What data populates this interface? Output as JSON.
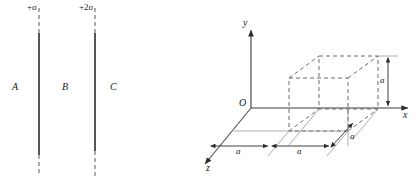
{
  "figure_left": {
    "name": "two-parallel-charged-sheets",
    "sheet_labels": [
      {
        "id": "sheet-1-charge-density",
        "text": "+σ"
      },
      {
        "id": "sheet-2-charge-density",
        "text": "+2σ"
      }
    ],
    "region_labels": [
      {
        "id": "region-A",
        "text": "A"
      },
      {
        "id": "region-B",
        "text": "B"
      },
      {
        "id": "region-C",
        "text": "C"
      }
    ],
    "sheet_lines": [
      {
        "id": "sheet-line-1",
        "x": 39,
        "solid_top": 33,
        "solid_bottom": 155,
        "dash_top": 8,
        "dash_bottom": 176
      },
      {
        "id": "sheet-line-2",
        "x": 95,
        "solid_top": 33,
        "solid_bottom": 150,
        "dash_top": 8,
        "dash_bottom": 176
      }
    ]
  },
  "figure_right": {
    "name": "cube-in-3d-coordinate-system",
    "axis_labels": [
      {
        "id": "axis-label-y",
        "text": "y"
      },
      {
        "id": "axis-label-x",
        "text": "x"
      },
      {
        "id": "axis-label-z",
        "text": "z"
      }
    ],
    "origin_label": {
      "id": "origin-O",
      "text": "O"
    },
    "dimension_labels": [
      {
        "id": "dim-a-left-x",
        "text": "a"
      },
      {
        "id": "dim-a-right-x",
        "text": "a"
      },
      {
        "id": "dim-a-depth-z",
        "text": "a"
      },
      {
        "id": "dim-a-height-y",
        "text": "a"
      }
    ],
    "cube": {
      "edge_length_label": "a",
      "front_bottom_left": [
        289,
        131
      ],
      "front_top_left": [
        289,
        78
      ],
      "front_bottom_right": [
        348,
        131
      ],
      "front_top_right": [
        348,
        78
      ],
      "depth_offset": [
        30,
        -22
      ]
    }
  },
  "colors": {
    "ink": "#1a1a1a",
    "line": "#3a3a3a",
    "dashed": "#5a5a5a",
    "background": "#ffffff"
  }
}
